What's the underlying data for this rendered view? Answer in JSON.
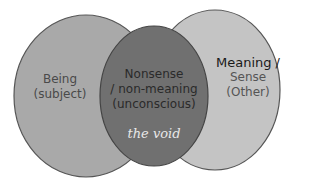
{
  "diagram": {
    "type": "venn",
    "left": {
      "line1": "Being",
      "line2": "(subject)",
      "fill": "#a9a9a9"
    },
    "right": {
      "line1": "Meaning /",
      "line2": "Sense",
      "line3": "(Other)",
      "fill": "#c4c4c4"
    },
    "center": {
      "line1": "Nonsense",
      "line2": "/ non-meaning",
      "line3": "(unconscious)",
      "fill": "#6f6f6f"
    },
    "void_label": "the void",
    "colors": {
      "stroke": "#555555",
      "text_dark": "#222222",
      "text_mid": "#555555",
      "text_light": "#e6e6e6"
    }
  }
}
